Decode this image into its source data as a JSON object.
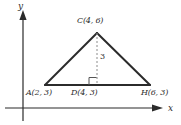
{
  "figure": {
    "colors": {
      "stroke": "#2b2b2b",
      "dashed": "#8c8c8c",
      "background": "#ffffff"
    },
    "axes": {
      "x_label": "x",
      "y_label": "y",
      "origin_px": {
        "x": 23,
        "y": 108
      },
      "x_axis": {
        "from_px": {
          "x": 5,
          "y": 108
        },
        "to_px": {
          "x": 158,
          "y": 108
        },
        "arrow": "right"
      },
      "y_axis": {
        "from_px": {
          "x": 23,
          "y": 120
        },
        "to_px": {
          "x": 23,
          "y": 14
        },
        "arrow": "up"
      }
    },
    "vertices": [
      {
        "name": "A",
        "label": "A(2, 3)",
        "coord_x": 2,
        "coord_y": 3,
        "px": {
          "x": 45,
          "y": 85
        }
      },
      {
        "name": "C",
        "label": "C(4, 6)",
        "coord_x": 4,
        "coord_y": 6,
        "px": {
          "x": 97,
          "y": 33
        }
      },
      {
        "name": "H",
        "label": "H(6, 3)",
        "coord_x": 6,
        "coord_y": 3,
        "px": {
          "x": 150,
          "y": 85
        }
      },
      {
        "name": "D",
        "label": "D(4, 3)",
        "coord_x": 4,
        "coord_y": 3,
        "px": {
          "x": 97,
          "y": 85
        }
      }
    ],
    "altitude": {
      "from": "C",
      "to": "D",
      "length_label": "3",
      "style": "dashed",
      "right_angle_marker": true
    },
    "sides": [
      {
        "from": "A",
        "to": "C"
      },
      {
        "from": "C",
        "to": "H"
      },
      {
        "from": "A",
        "to": "H"
      }
    ]
  }
}
